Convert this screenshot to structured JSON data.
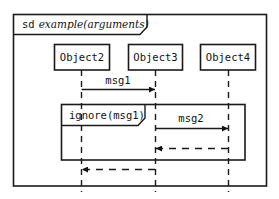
{
  "diagram": {
    "type": "sequence",
    "frame": {
      "keyword": "sd",
      "name": "example(arguments)"
    },
    "lifelines": [
      {
        "name": "Object2"
      },
      {
        "name": "Object3"
      },
      {
        "name": "Object4"
      }
    ],
    "messages": [
      {
        "label": "msg1",
        "from": "Object2",
        "to": "Object3",
        "style": "sync"
      },
      {
        "label": "msg2",
        "from": "Object3",
        "to": "Object4",
        "style": "sync"
      },
      {
        "label": "",
        "from": "Object4",
        "to": "Object3",
        "style": "return"
      },
      {
        "label": "",
        "from": "Object3",
        "to": "Object2",
        "style": "return"
      }
    ],
    "fragments": [
      {
        "operator": "ignore(msg1)",
        "covers": [
          "Object2",
          "Object3",
          "Object4"
        ]
      }
    ]
  }
}
